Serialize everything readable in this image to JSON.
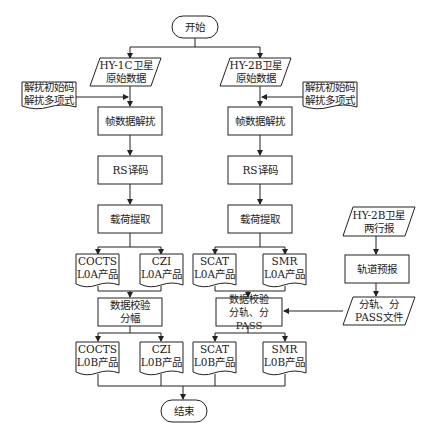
{
  "start": "开始",
  "end": "结束",
  "left": {
    "input": "HY-1C卫星\n原始数据",
    "param_doc": "解扰初始码\n解扰多项式",
    "step1": "帧数据解扰",
    "step2": "RS译码",
    "step3": "载荷提取",
    "l0a_1": "COCTS\nL0A产品",
    "l0a_2": "CZI\nL0A产品",
    "step4": "数据校验\n分幅",
    "l0b_1": "COCTS\nL0B产品",
    "l0b_2": "CZI\nL0B产品"
  },
  "right": {
    "input": "HY-2B卫星\n原始数据",
    "param_doc": "解扰初始码\n解扰多项式",
    "step1": "帧数据解扰",
    "step2": "RS译码",
    "step3": "载荷提取",
    "l0a_1": "SCAT\nL0A产品",
    "l0a_2": "SMR\nL0A产品",
    "step4": "数据校验\n分轨、分PASS",
    "l0b_1": "SCAT\nL0B产品",
    "l0b_2": "SMR\nL0B产品"
  },
  "orbit": {
    "input": "HY-2B卫星\n两行报",
    "step": "轨道预报",
    "output": "分轨、分\nPASS文件"
  }
}
